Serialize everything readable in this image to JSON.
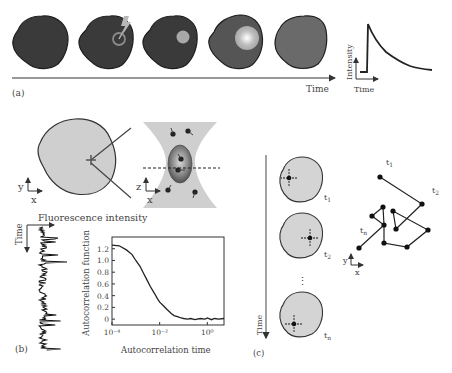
{
  "panel_a": {
    "label": "(a)",
    "time_axis_label": "Time",
    "inset": {
      "ylabel": "Intensity",
      "xlabel": "Time"
    },
    "cells": [
      {
        "stage": "pre-bleach",
        "fill": "#3a3a3a"
      },
      {
        "stage": "bleach-pulse",
        "fill": "#3a3a3a"
      },
      {
        "stage": "bleached-spot",
        "fill": "#3a3a3a"
      },
      {
        "stage": "recovering",
        "fill": "#555555"
      },
      {
        "stage": "recovered",
        "fill": "#6a6a6a"
      }
    ]
  },
  "panel_b": {
    "label": "(b)",
    "cell_axes": {
      "y": "y",
      "x": "x"
    },
    "focal_axes": {
      "z": "z",
      "x": "x"
    },
    "trace_title": "Fluorescence intensity",
    "trace_time_label": "Time",
    "acf_chart": {
      "ylabel": "Autocorrelation function",
      "xlabel": "Autocorrelation time"
    }
  },
  "panel_c": {
    "label": "(c)",
    "time_label": "Time",
    "ellipsis": "⋮",
    "frames": [
      {
        "label_base": "t",
        "label_sub": "1"
      },
      {
        "label_base": "t",
        "label_sub": "2"
      },
      {
        "label_base": "t",
        "label_sub": "n"
      }
    ],
    "trajectory_labels": {
      "start": {
        "base": "t",
        "sub": "1"
      },
      "second": {
        "base": "t",
        "sub": "2"
      },
      "end": {
        "base": "t",
        "sub": "n"
      }
    },
    "traj_axes": {
      "y": "y",
      "x": "x"
    }
  },
  "chart_data": {
    "type": "line",
    "title": "",
    "xlabel": "Autocorrelation time",
    "ylabel": "Autocorrelation function",
    "xscale": "log",
    "xlim": [
      0.0001,
      5
    ],
    "ylim": [
      -0.1,
      1.4
    ],
    "xticks": [
      {
        "value": 0.0001,
        "label": "10⁻⁴"
      },
      {
        "value": 0.01,
        "label": "10⁻²"
      },
      {
        "value": 1,
        "label": "10⁰"
      }
    ],
    "yticks": [
      0,
      0.2,
      0.4,
      0.6,
      0.8,
      1.0,
      1.2
    ],
    "ytick_labels": [
      "0",
      "0.2",
      "0.4",
      "0.6",
      "0.8",
      "1.0",
      "1.2"
    ],
    "grid": false,
    "series": [
      {
        "name": "G(tau)",
        "x": [
          0.0001,
          0.0002,
          0.0004,
          0.0007,
          0.001,
          0.0015,
          0.002,
          0.003,
          0.004,
          0.006,
          0.008,
          0.01,
          0.015,
          0.02,
          0.03,
          0.04,
          0.06,
          0.08,
          0.1,
          0.15,
          0.2,
          0.3,
          0.5,
          0.8,
          1,
          1.5,
          2,
          3,
          5
        ],
        "y": [
          1.26,
          1.25,
          1.18,
          1.1,
          1.0,
          0.9,
          0.8,
          0.66,
          0.56,
          0.44,
          0.35,
          0.29,
          0.22,
          0.17,
          0.1,
          0.06,
          0.04,
          0.02,
          0.01,
          0.0,
          0.01,
          -0.01,
          0.01,
          0.0,
          0.02,
          -0.01,
          0.01,
          0.0,
          0.01
        ]
      }
    ]
  }
}
